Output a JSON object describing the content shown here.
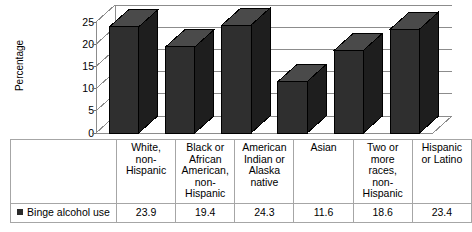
{
  "chart_data": {
    "type": "bar",
    "title": "",
    "subtitle": "",
    "xlabel": "",
    "ylabel": "Percentage",
    "ylim": [
      0,
      25
    ],
    "yticks": [
      0,
      5,
      10,
      15,
      20,
      25
    ],
    "ytick_labels": [
      "0",
      "5",
      "10",
      "15",
      "20",
      "25"
    ],
    "grid": true,
    "grid_axis": "y",
    "legend_position": "bottom-left-table",
    "three_d": true,
    "categories": [
      "White, non-Hispanic",
      "Black or African American, non-Hispanic",
      "American Indian or Alaska native",
      "Asian",
      "Two or more races, non-Hispanic",
      "Hispanic or Latino"
    ],
    "category_lines": [
      [
        "White,",
        "non-",
        "Hispanic"
      ],
      [
        "Black or",
        "African",
        "American,",
        "non-",
        "Hispanic"
      ],
      [
        "American",
        "Indian or",
        "Alaska",
        "native"
      ],
      [
        "Asian"
      ],
      [
        "Two or",
        "more",
        "races,",
        "non-",
        "Hispanic"
      ],
      [
        "Hispanic",
        "or Latino"
      ]
    ],
    "series": [
      {
        "name": "Binge alcohol use",
        "values": [
          23.9,
          19.4,
          24.3,
          11.6,
          18.6,
          23.4
        ],
        "value_labels": [
          "23.9",
          "19.4",
          "24.3",
          "11.6",
          "18.6",
          "23.4"
        ],
        "color": "#2b2b2b"
      }
    ]
  },
  "legend": {
    "marker_name": "series-color-swatch",
    "label": "Binge alcohol use"
  },
  "colors": {
    "bar_front": "#2f2f2f",
    "bar_top": "#4a4a4a",
    "bar_side": "#1e1e1e",
    "gridline": "#8c8c8c",
    "axis": "#6f6f6f",
    "table_border": "#a6a6a6",
    "background": "#ffffff"
  }
}
